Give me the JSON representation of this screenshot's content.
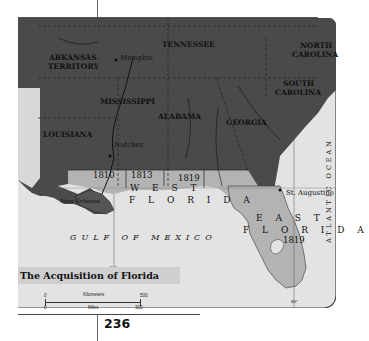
{
  "map": {
    "title": "The Acquisition of Florida",
    "page_number": "236",
    "states": [
      "ARKANSAS",
      "TERRITORY",
      "TENNESSEE",
      "NORTH",
      "CAROLINA",
      "SOUTH",
      "CAROLINA",
      "MISSISSIPPI",
      "ALABAMA",
      "GEORGIA",
      "LOUISIANA"
    ],
    "labels": {
      "arkansas_1": "ARKANSAS",
      "arkansas_2": "TERRITORY",
      "tennessee": "TENNESSEE",
      "nc_1": "NORTH",
      "nc_2": "CAROLINA",
      "sc_1": "SOUTH",
      "sc_2": "CAROLINA",
      "mississippi": "MISSISSIPPI",
      "alabama": "ALABAMA",
      "georgia": "GEORGIA",
      "louisiana": "LOUISIANA",
      "west_1": "W E S T",
      "west_2": "F L O R I D A",
      "east_1": "E A S T",
      "east_2": "F L O R I D A",
      "gulf": "GULF OF MEXICO",
      "ocean": "ATLANTIC OCEAN",
      "river_mississippi": "Mississippi",
      "river_chattahoochee": "Chattahoochee"
    },
    "cities": {
      "memphis": "Memphis",
      "natchez": "Natchez",
      "new_orleans": "New Orleans",
      "st_augustine": "St. Augustine"
    },
    "years": {
      "y1810": "1810",
      "y1813": "1813",
      "y1819w": "1819",
      "y1819e": "1819",
      "y1819la": "1819"
    },
    "longitudes": {
      "l90": "90°",
      "l80": "80°"
    },
    "legend": {
      "scale": {
        "km_label": "Kilometers",
        "km_start": "0",
        "km_end": "500",
        "mi_label": "Miles",
        "mi_start": "0",
        "mi_end": "300"
      }
    },
    "colors": {
      "us_territory": "#4a4a4a",
      "acquired": "#b3b3b3",
      "water": "#e3e3e3",
      "title_bg": "#cfcfcf"
    }
  }
}
